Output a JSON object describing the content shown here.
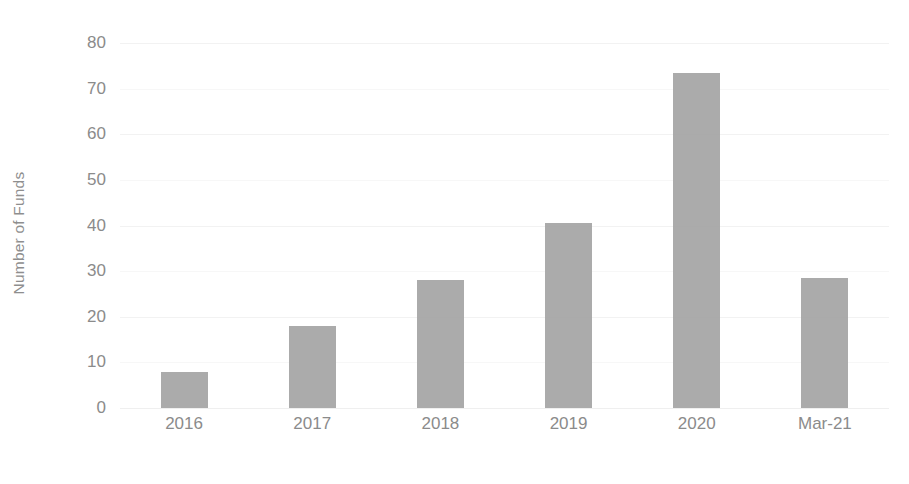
{
  "chart_data": {
    "type": "bar",
    "title": "",
    "subtitle": "",
    "xlabel": "",
    "ylabel": "Number of Funds",
    "categories": [
      "2016",
      "2017",
      "2018",
      "2019",
      "2020",
      "Mar-21"
    ],
    "values": [
      8,
      18,
      28,
      40.5,
      73.5,
      28.5
    ],
    "ylim": [
      0,
      80
    ],
    "yticks": [
      0,
      10,
      20,
      30,
      40,
      50,
      60,
      70,
      80
    ],
    "ytick_labels": [
      "0",
      "10",
      "20",
      "30",
      "40",
      "50",
      "60",
      "70",
      "80"
    ],
    "grid": true,
    "grid_axis": "y",
    "legend": false,
    "legend_position": "none",
    "bar_color": "#a5a5a5",
    "background_color": "#ffffff",
    "axis_text_color": "#8b8b8b",
    "gridline_color": "#f4f4f4",
    "series": [
      {
        "name": "Number of Funds",
        "values": [
          8,
          18,
          28,
          40.5,
          73.5,
          28.5
        ]
      }
    ]
  }
}
